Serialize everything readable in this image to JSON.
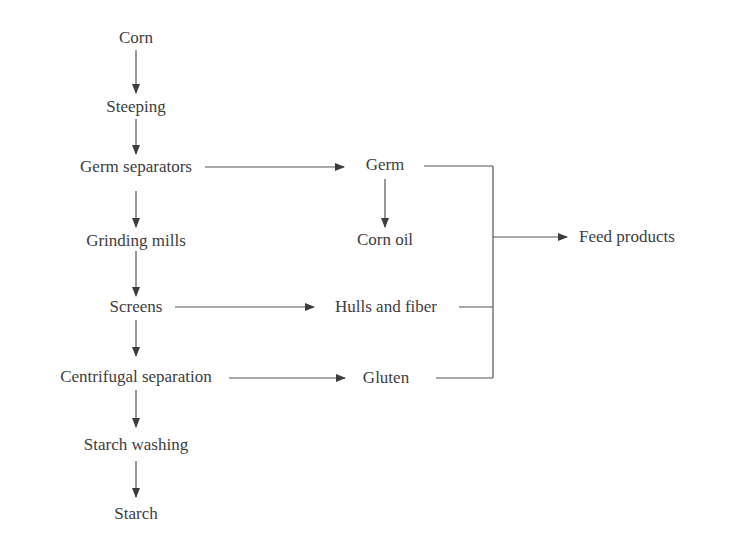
{
  "diagram": {
    "type": "process-flowchart",
    "main_column": [
      {
        "id": "corn",
        "label": "Corn"
      },
      {
        "id": "steeping",
        "label": "Steeping"
      },
      {
        "id": "germ_separators",
        "label": "Germ separators"
      },
      {
        "id": "grinding_mills",
        "label": "Grinding mills"
      },
      {
        "id": "screens",
        "label": "Screens"
      },
      {
        "id": "centrifugal_separation",
        "label": "Centrifugal separation"
      },
      {
        "id": "starch_washing",
        "label": "Starch washing"
      },
      {
        "id": "starch",
        "label": "Starch"
      }
    ],
    "side_column": [
      {
        "id": "germ",
        "label": "Germ"
      },
      {
        "id": "corn_oil",
        "label": "Corn oil"
      },
      {
        "id": "hulls_fiber",
        "label": "Hulls and fiber"
      },
      {
        "id": "gluten",
        "label": "Gluten"
      }
    ],
    "output": {
      "id": "feed_products",
      "label": "Feed products"
    },
    "edges": [
      {
        "from": "corn",
        "to": "steeping"
      },
      {
        "from": "steeping",
        "to": "germ_separators"
      },
      {
        "from": "germ_separators",
        "to": "grinding_mills"
      },
      {
        "from": "grinding_mills",
        "to": "screens"
      },
      {
        "from": "screens",
        "to": "centrifugal_separation"
      },
      {
        "from": "centrifugal_separation",
        "to": "starch_washing"
      },
      {
        "from": "starch_washing",
        "to": "starch"
      },
      {
        "from": "germ_separators",
        "to": "germ"
      },
      {
        "from": "germ",
        "to": "corn_oil"
      },
      {
        "from": "screens",
        "to": "hulls_fiber"
      },
      {
        "from": "centrifugal_separation",
        "to": "gluten"
      },
      {
        "from": [
          "germ",
          "hulls_fiber",
          "gluten"
        ],
        "to": "feed_products"
      }
    ],
    "colors": {
      "line": "#3d3d3d",
      "text": "#3d3d3d",
      "background": "#ffffff"
    }
  }
}
